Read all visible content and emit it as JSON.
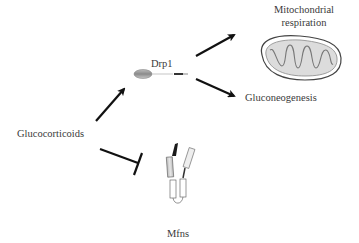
{
  "diagram": {
    "nodes": {
      "glucocorticoids": {
        "label": "Glucocorticoids"
      },
      "drp1": {
        "label": "Drp1"
      },
      "mito_respiration": {
        "label_line1": "Mitochondrial",
        "label_line2": "respiration"
      },
      "gluconeogenesis": {
        "label": "Gluconeogenesis"
      },
      "mfns": {
        "label": "Mfns"
      }
    },
    "edges": [
      {
        "from": "glucocorticoids",
        "to": "drp1",
        "type": "activation-arrow"
      },
      {
        "from": "drp1",
        "to": "mito_respiration",
        "type": "activation-arrow"
      },
      {
        "from": "drp1",
        "to": "gluconeogenesis",
        "type": "activation-arrow"
      },
      {
        "from": "glucocorticoids",
        "to": "mfns",
        "type": "inhibition-bar"
      }
    ],
    "icons": {
      "drp1": "drp1-protein-icon",
      "mitochondrion": "mitochondrion-icon",
      "mfns": "mitofusin-dimer-icon"
    },
    "colors": {
      "arrow": "#111111",
      "text": "#3a3a3a",
      "mito_fill": "#d9d9d9",
      "mito_outline": "#444444"
    }
  }
}
